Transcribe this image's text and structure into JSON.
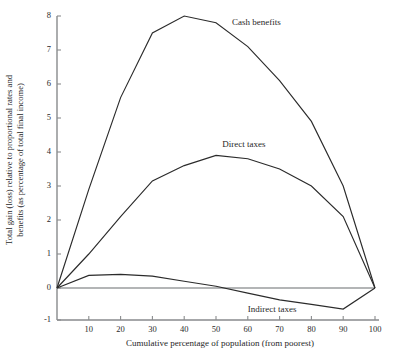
{
  "chart_data": {
    "type": "line",
    "title": "",
    "xlabel": "Cumulative percentage of population (from poorest)",
    "ylabel_line1": "Total gain (loss) relative to proportional rates and",
    "ylabel_line2": "benefits (as percentage of total final income)",
    "xlim": [
      0,
      103
    ],
    "ylim": [
      -1,
      8
    ],
    "xticks": [
      10,
      20,
      30,
      40,
      50,
      60,
      70,
      80,
      90,
      100
    ],
    "yticks": [
      -1,
      0,
      1,
      2,
      3,
      4,
      5,
      6,
      7,
      8
    ],
    "xtick_labels": [
      "10",
      "20",
      "30",
      "40",
      "50",
      "60",
      "70",
      "80",
      "90",
      "100"
    ],
    "ytick_labels": [
      "-1",
      "0",
      "1",
      "2",
      "3",
      "4",
      "5",
      "6",
      "7",
      "8"
    ],
    "grid": false,
    "legend_position": "inline-annotations",
    "series": [
      {
        "name": "Cash benefits",
        "label_x": 55,
        "label_y": 7.75,
        "x": [
          0,
          10,
          20,
          30,
          40,
          50,
          60,
          70,
          80,
          90,
          100
        ],
        "values": [
          0.0,
          2.9,
          5.6,
          7.5,
          8.0,
          7.8,
          7.1,
          6.1,
          4.9,
          3.0,
          0.0
        ]
      },
      {
        "name": "Direct taxes",
        "label_x": 52,
        "label_y": 4.15,
        "x": [
          0,
          10,
          20,
          30,
          40,
          50,
          60,
          70,
          80,
          90,
          100
        ],
        "values": [
          0.0,
          1.0,
          2.1,
          3.15,
          3.6,
          3.9,
          3.8,
          3.5,
          3.0,
          2.1,
          0.0
        ]
      },
      {
        "name": "Indirect taxes",
        "label_x": 60,
        "label_y": -0.72,
        "x": [
          0,
          10,
          20,
          30,
          40,
          50,
          60,
          70,
          80,
          90,
          100
        ],
        "values": [
          0.0,
          0.37,
          0.4,
          0.35,
          0.2,
          0.05,
          -0.15,
          -0.35,
          -0.48,
          -0.62,
          0.0
        ]
      }
    ]
  }
}
